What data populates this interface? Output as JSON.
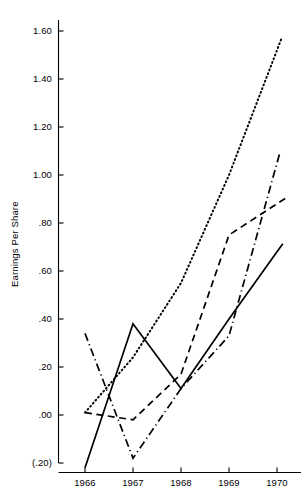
{
  "chart_data": {
    "type": "line",
    "title": "",
    "xlabel": "",
    "ylabel": "Earnings Per Share",
    "categories": [
      "1966",
      "1967",
      "1968",
      "1969",
      "1970"
    ],
    "x": [
      1966,
      1967,
      1968,
      1969,
      1970
    ],
    "xlim": [
      1965.7,
      1970.2
    ],
    "ylim": [
      -0.2,
      1.6
    ],
    "grid": false,
    "legend": "none",
    "y_tick_labels": [
      "1.60",
      "1.40",
      "1.20",
      "1.00",
      ".80",
      ".60",
      ".40",
      ".20",
      ".00",
      "(.20)"
    ],
    "y_tick_values": [
      1.6,
      1.4,
      1.2,
      1.0,
      0.8,
      0.6,
      0.4,
      0.2,
      0.0,
      -0.2
    ],
    "x_tick_labels": [
      "1966",
      "1967",
      "1968",
      "1969",
      "1970"
    ],
    "series": [
      {
        "name": "series-solid",
        "style": "solid",
        "color": "#000000",
        "values": [
          -0.22,
          0.38,
          0.11,
          0.4,
          0.68
        ]
      },
      {
        "name": "series-dashed",
        "style": "dashed",
        "color": "#000000",
        "values": [
          0.01,
          -0.02,
          0.17,
          0.75,
          0.88
        ]
      },
      {
        "name": "series-dotted",
        "style": "dotted",
        "color": "#000000",
        "values": [
          0.01,
          0.24,
          0.55,
          1.0,
          1.52
        ]
      },
      {
        "name": "series-dash-dot",
        "style": "dash-dot",
        "color": "#000000",
        "values": [
          0.34,
          -0.18,
          0.11,
          0.33,
          1.05
        ]
      }
    ]
  },
  "axes": {
    "y_title": "Earnings Per Share"
  }
}
